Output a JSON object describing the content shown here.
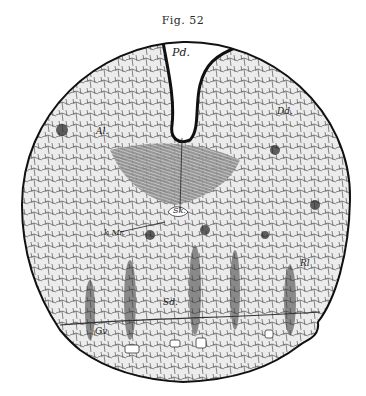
{
  "figure": {
    "caption": "Fig. 52",
    "labels": {
      "pd": "Pd.",
      "ms": "Ms",
      "al": "Al.",
      "dd": "Dd.",
      "sk": "Sk.",
      "kmr": "k.Mr.",
      "sd": "Sd.",
      "rl": "Rl",
      "gv": "Gv"
    },
    "colors": {
      "ink": "#1a1a1a",
      "paper": "#ffffff",
      "tissue": "#e9e9e9"
    }
  }
}
